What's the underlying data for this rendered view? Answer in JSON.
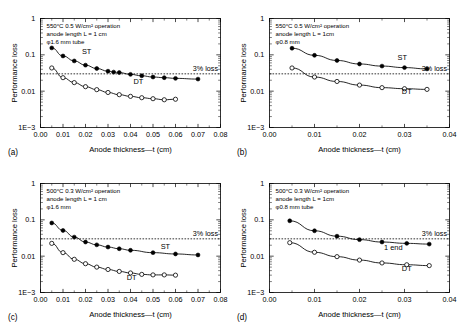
{
  "figure": {
    "panels": [
      {
        "key": "a",
        "panel_label": "(a)",
        "annotation": [
          "550°C 0.5 W/cm² operation",
          "anode length L = 1 cm",
          "φ1.6 mm tube"
        ],
        "threshold_label": "3% loss",
        "chart_data": {
          "type": "line",
          "title": "",
          "xlabel": "Anode thickness—t (cm)",
          "ylabel": "Performance loss",
          "xlim": [
            0.0,
            0.08
          ],
          "ylim": [
            0.001,
            1
          ],
          "yscale": "log",
          "xticks": [
            0.0,
            0.01,
            0.02,
            0.03,
            0.04,
            0.05,
            0.06,
            0.07,
            0.08
          ],
          "xticklabels": [
            "0.00",
            "0.01",
            "0.02",
            "0.03",
            "0.04",
            "0.05",
            "0.06",
            "0.07",
            "0.08"
          ],
          "yticks": [
            1,
            0.1,
            0.01,
            0.001
          ],
          "yticklabels": [
            "1",
            "0.1",
            "0.01",
            "1E−3"
          ],
          "grid": false,
          "threshold": 0.03,
          "series": [
            {
              "name": "ST",
              "marker": "filled-circle",
              "label_x": 0.0205,
              "label_y": 0.105,
              "x": [
                0.005,
                0.01,
                0.015,
                0.02,
                0.025,
                0.03,
                0.0325,
                0.035,
                0.04,
                0.045,
                0.05,
                0.055,
                0.06,
                0.07
              ],
              "y": [
                0.155,
                0.093,
                0.068,
                0.052,
                0.042,
                0.0355,
                0.0335,
                0.0325,
                0.029,
                0.0265,
                0.0245,
                0.0235,
                0.0225,
                0.0215
              ]
            },
            {
              "name": "DT",
              "marker": "open-circle",
              "label_x": 0.0435,
              "label_y": 0.0155,
              "x": [
                0.005,
                0.01,
                0.015,
                0.02,
                0.025,
                0.03,
                0.035,
                0.04,
                0.045,
                0.05,
                0.055,
                0.06
              ],
              "y": [
                0.0435,
                0.0235,
                0.0172,
                0.0133,
                0.011,
                0.0092,
                0.008,
                0.0072,
                0.0066,
                0.0062,
                0.0058,
                0.006
              ]
            }
          ]
        }
      },
      {
        "key": "b",
        "panel_label": "(b)",
        "annotation": [
          "550°C 0.5 W/cm² operation",
          "anode length L = 1cm",
          "φ0.8 mm"
        ],
        "threshold_label": "3% loss",
        "chart_data": {
          "type": "line",
          "title": "",
          "xlabel": "Anode thickness—t (cm)",
          "ylabel": "Performance loss",
          "xlim": [
            0.0,
            0.04
          ],
          "ylim": [
            0.001,
            1
          ],
          "yscale": "log",
          "xticks": [
            0.0,
            0.01,
            0.02,
            0.03,
            0.04
          ],
          "xticklabels": [
            "0.00",
            "0.01",
            "0.02",
            "0.03",
            "0.04"
          ],
          "yticks": [
            1,
            0.1,
            0.01,
            0.001
          ],
          "yticklabels": [
            "1",
            "0.1",
            "0.01",
            "1E−3"
          ],
          "grid": false,
          "threshold": 0.03,
          "series": [
            {
              "name": "ST",
              "marker": "filled-circle",
              "label_x": 0.0295,
              "label_y": 0.072,
              "x": [
                0.005,
                0.01,
                0.015,
                0.02,
                0.025,
                0.03,
                0.035
              ],
              "y": [
                0.152,
                0.097,
                0.07,
                0.056,
                0.049,
                0.0445,
                0.041
              ]
            },
            {
              "name": "DT",
              "marker": "open-circle",
              "label_x": 0.0305,
              "label_y": 0.0082,
              "x": [
                0.005,
                0.01,
                0.015,
                0.02,
                0.025,
                0.03,
                0.035
              ],
              "y": [
                0.0435,
                0.0245,
                0.0185,
                0.0147,
                0.0125,
                0.0117,
                0.0112
              ]
            }
          ]
        }
      },
      {
        "key": "c",
        "panel_label": "(c)",
        "annotation": [
          "500°C 0.3 W/cm² operation",
          "anode length L = 1 cm",
          "φ1.6 mm"
        ],
        "threshold_label": "3% loss",
        "chart_data": {
          "type": "line",
          "title": "",
          "xlabel": "Anode thickness—t (cm)",
          "ylabel": "Performance loss",
          "xlim": [
            0.0,
            0.08
          ],
          "ylim": [
            0.001,
            1
          ],
          "yscale": "log",
          "xticks": [
            0.0,
            0.01,
            0.02,
            0.03,
            0.04,
            0.05,
            0.06,
            0.07,
            0.08
          ],
          "xticklabels": [
            "0.00",
            "0.01",
            "0.02",
            "0.03",
            "0.04",
            "0.05",
            "0.06",
            "0.07",
            "0.08"
          ],
          "yticks": [
            1,
            0.1,
            0.01,
            0.001
          ],
          "yticklabels": [
            "1",
            "0.1",
            "0.01",
            "1E−3"
          ],
          "grid": false,
          "threshold": 0.03,
          "series": [
            {
              "name": "ST",
              "marker": "filled-circle",
              "label_x": 0.0555,
              "label_y": 0.0155,
              "x": [
                0.005,
                0.01,
                0.015,
                0.02,
                0.025,
                0.03,
                0.035,
                0.04,
                0.05,
                0.06,
                0.07
              ],
              "y": [
                0.082,
                0.051,
                0.0335,
                0.0245,
                0.0205,
                0.0178,
                0.016,
                0.0145,
                0.0125,
                0.0115,
                0.0108
              ]
            },
            {
              "name": "DT",
              "marker": "open-circle",
              "label_x": 0.0405,
              "label_y": 0.00225,
              "x": [
                0.005,
                0.01,
                0.015,
                0.02,
                0.025,
                0.03,
                0.035,
                0.04,
                0.045,
                0.05,
                0.055,
                0.06
              ],
              "y": [
                0.0225,
                0.0125,
                0.0082,
                0.0062,
                0.005,
                0.0043,
                0.0038,
                0.00345,
                0.00315,
                0.00305,
                0.00305,
                0.003
              ]
            }
          ]
        }
      },
      {
        "key": "d",
        "panel_label": "(d)",
        "annotation": [
          "500°C 0.3 W/cm² operation",
          "anode length L = 1cm",
          "φ0.8 mm tube"
        ],
        "threshold_label": "3% loss",
        "chart_data": {
          "type": "line",
          "title": "",
          "xlabel": "Anode thickness—t (cm)",
          "ylabel": "Performance loss",
          "xlim": [
            0.0,
            0.04
          ],
          "ylim": [
            0.001,
            1
          ],
          "yscale": "log",
          "xticks": [
            0.0,
            0.01,
            0.02,
            0.03,
            0.04
          ],
          "xticklabels": [
            "0.00",
            "0.01",
            "0.02",
            "0.03",
            "0.04"
          ],
          "yticks": [
            1,
            0.1,
            0.01,
            0.001
          ],
          "yticklabels": [
            "1",
            "0.1",
            "0.01",
            "1E−3"
          ],
          "grid": false,
          "threshold": 0.03,
          "series": [
            {
              "name": "1 end",
              "marker": "filled-circle",
              "label_x": 0.0275,
              "label_y": 0.0152,
              "x": [
                0.0045,
                0.01,
                0.015,
                0.02,
                0.025,
                0.0305,
                0.0355
              ],
              "y": [
                0.094,
                0.05,
                0.0355,
                0.0285,
                0.0245,
                0.0225,
                0.0215
              ]
            },
            {
              "name": "DT",
              "marker": "open-circle",
              "label_x": 0.0305,
              "label_y": 0.004,
              "x": [
                0.0045,
                0.01,
                0.015,
                0.02,
                0.025,
                0.0305,
                0.0355
              ],
              "y": [
                0.0235,
                0.0128,
                0.0097,
                0.0078,
                0.0065,
                0.0058,
                0.0055
              ]
            }
          ]
        }
      }
    ]
  }
}
